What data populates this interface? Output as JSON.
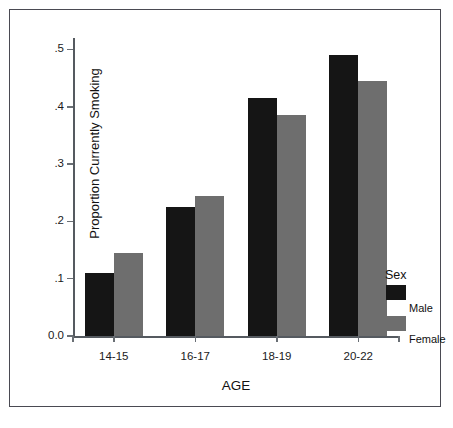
{
  "chart_data": {
    "type": "bar",
    "title": "",
    "xlabel": "AGE",
    "ylabel": "Proportion Currently Smoking",
    "categories": [
      "14-15",
      "16-17",
      "18-19",
      "20-22"
    ],
    "series": [
      {
        "name": "Male",
        "color": "#151515",
        "values": [
          0.11,
          0.225,
          0.415,
          0.49
        ]
      },
      {
        "name": "Female",
        "color": "#6e6e6e",
        "values": [
          0.145,
          0.245,
          0.385,
          0.445
        ]
      }
    ],
    "ylim": [
      0.0,
      0.52
    ],
    "yticks": [
      0.0,
      0.1,
      0.2,
      0.3,
      0.4,
      0.5
    ],
    "ytick_labels": [
      "0.0",
      ".1",
      ".2",
      ".3",
      ".4",
      ".5"
    ],
    "grid": false,
    "legend": {
      "title": "Sex",
      "position": "right",
      "entries": [
        {
          "label": "Male",
          "color": "#151515"
        },
        {
          "label": "Female",
          "color": "#6e6e6e"
        }
      ]
    }
  }
}
